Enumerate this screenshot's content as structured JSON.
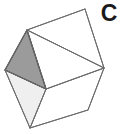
{
  "figure": {
    "label": "C",
    "shape_name": "polyhedron-cube-outline",
    "canvas": {
      "width": 120,
      "height": 134,
      "background": "#ffffff"
    },
    "colors": {
      "stroke": "#6b6b6b",
      "stroke_dark": "#3f3f3f",
      "face_white": "#ffffff",
      "face_light_gray": "#efefef",
      "face_dark_gray": "#9b9b9b",
      "label_color": "#1a1a1a"
    },
    "stroke_width": 1,
    "vertices": {
      "top": [
        85,
        9
      ],
      "upper_left": [
        27,
        30
      ],
      "left": [
        5,
        70
      ],
      "bottom": [
        30,
        128
      ],
      "bottom_right": [
        88,
        110
      ],
      "right": [
        104,
        68
      ],
      "center": [
        46,
        89
      ]
    },
    "faces": [
      {
        "name": "dark-triangle",
        "points": "27,30 5,70 46,89",
        "fill": "#9b9b9b",
        "stroke": "#3f3f3f"
      },
      {
        "name": "light-triangle",
        "points": "5,70 30,128 46,89",
        "fill": "#efefef",
        "stroke": "#6b6b6b"
      },
      {
        "name": "white-triangle-upper",
        "points": "27,30 85,9 104,68",
        "fill": "#ffffff",
        "stroke": "#6b6b6b"
      },
      {
        "name": "white-triangle-lower",
        "points": "27,30 104,68 46,89",
        "fill": "#ffffff",
        "stroke": "#6b6b6b"
      },
      {
        "name": "white-face-bottom-right",
        "points": "46,89 104,68 88,110 30,128",
        "fill": "#ffffff",
        "stroke": "#6b6b6b"
      }
    ],
    "edges": [
      {
        "name": "edge-top-to-upper-left",
        "from": [
          85,
          9
        ],
        "to": [
          27,
          30
        ]
      },
      {
        "name": "edge-top-to-right",
        "from": [
          85,
          9
        ],
        "to": [
          104,
          68
        ]
      },
      {
        "name": "edge-upper-left-to-left",
        "from": [
          27,
          30
        ],
        "to": [
          5,
          70
        ]
      },
      {
        "name": "edge-left-to-bottom",
        "from": [
          5,
          70
        ],
        "to": [
          30,
          128
        ]
      },
      {
        "name": "edge-bottom-to-bottom-right",
        "from": [
          30,
          128
        ],
        "to": [
          88,
          110
        ]
      },
      {
        "name": "edge-bottom-right-to-right",
        "from": [
          88,
          110
        ],
        "to": [
          104,
          68
        ]
      },
      {
        "name": "edge-upper-left-to-right",
        "from": [
          27,
          30
        ],
        "to": [
          104,
          68
        ]
      },
      {
        "name": "edge-upper-left-to-center",
        "from": [
          27,
          30
        ],
        "to": [
          46,
          89
        ]
      },
      {
        "name": "edge-left-to-center",
        "from": [
          5,
          70
        ],
        "to": [
          46,
          89
        ]
      },
      {
        "name": "edge-center-to-right",
        "from": [
          46,
          89
        ],
        "to": [
          104,
          68
        ]
      },
      {
        "name": "edge-center-to-bottom",
        "from": [
          46,
          89
        ],
        "to": [
          30,
          128
        ]
      }
    ]
  }
}
